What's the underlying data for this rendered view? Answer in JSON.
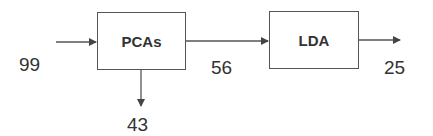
{
  "diagram": {
    "type": "flow",
    "nodes": [
      {
        "id": "pcas",
        "label": "PCAs"
      },
      {
        "id": "lda",
        "label": "LDA"
      }
    ],
    "edges": [
      {
        "from": "input",
        "to": "pcas",
        "label": "99"
      },
      {
        "from": "pcas",
        "to": "output-down",
        "label": "43"
      },
      {
        "from": "pcas",
        "to": "lda",
        "label": "56"
      },
      {
        "from": "lda",
        "to": "output",
        "label": "25"
      }
    ]
  },
  "colors": {
    "stroke": "#555555",
    "text": "#333333",
    "background": "#ffffff"
  }
}
